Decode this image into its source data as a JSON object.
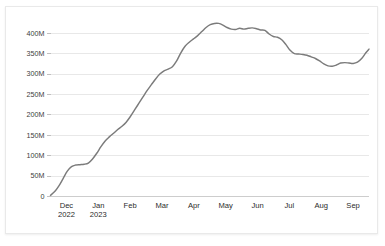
{
  "panel": {
    "background": "#ffffff",
    "border_color": "#e9e9e9"
  },
  "chart_data": {
    "type": "line",
    "title": "",
    "subtitle": "",
    "xlabel": "",
    "ylabel": "",
    "grid": true,
    "legend": false,
    "line_color": "#7b7b7b",
    "gridline_color": "#e2e2e2",
    "axis_color": "#c8c8c8",
    "ylim": [
      0,
      425000000
    ],
    "ytick_values": [
      0,
      50000000,
      100000000,
      150000000,
      200000000,
      250000000,
      300000000,
      350000000,
      400000000
    ],
    "ytick_labels": [
      "0",
      "50M",
      "100M",
      "150M",
      "200M",
      "250M",
      "300M",
      "350M",
      "400M"
    ],
    "xtick_labels": [
      {
        "month": "Dec",
        "year": "2022"
      },
      {
        "month": "Jan",
        "year": "2023"
      },
      {
        "month": "Feb",
        "year": ""
      },
      {
        "month": "Mar",
        "year": ""
      },
      {
        "month": "Apr",
        "year": ""
      },
      {
        "month": "May",
        "year": ""
      },
      {
        "month": "Jun",
        "year": ""
      },
      {
        "month": "Jul",
        "year": ""
      },
      {
        "month": "Aug",
        "year": ""
      },
      {
        "month": "Sep",
        "year": ""
      }
    ],
    "x_range": [
      "2022-12-01",
      "2023-09-30"
    ],
    "series": [
      {
        "name": "value",
        "x": [
          "2022-12-01",
          "2022-12-05",
          "2022-12-09",
          "2022-12-13",
          "2022-12-17",
          "2022-12-21",
          "2022-12-25",
          "2022-12-29",
          "2023-01-02",
          "2023-01-06",
          "2023-01-10",
          "2023-01-14",
          "2023-01-18",
          "2023-01-22",
          "2023-01-26",
          "2023-01-30",
          "2023-02-03",
          "2023-02-07",
          "2023-02-11",
          "2023-02-15",
          "2023-02-19",
          "2023-02-23",
          "2023-02-27",
          "2023-03-03",
          "2023-03-07",
          "2023-03-11",
          "2023-03-15",
          "2023-03-19",
          "2023-03-23",
          "2023-03-27",
          "2023-03-31",
          "2023-04-04",
          "2023-04-08",
          "2023-04-12",
          "2023-04-16",
          "2023-04-20",
          "2023-04-24",
          "2023-04-28",
          "2023-05-02",
          "2023-05-06",
          "2023-05-10",
          "2023-05-14",
          "2023-05-18",
          "2023-05-22",
          "2023-05-26",
          "2023-05-30",
          "2023-06-03",
          "2023-06-07",
          "2023-06-11",
          "2023-06-15",
          "2023-06-19",
          "2023-06-23",
          "2023-06-27",
          "2023-07-01",
          "2023-07-05",
          "2023-07-09",
          "2023-07-13",
          "2023-07-17",
          "2023-07-21",
          "2023-07-25",
          "2023-07-29",
          "2023-08-02",
          "2023-08-06",
          "2023-08-10",
          "2023-08-14",
          "2023-08-18",
          "2023-08-22",
          "2023-08-26",
          "2023-08-30",
          "2023-09-03",
          "2023-09-07",
          "2023-09-11",
          "2023-09-15",
          "2023-09-19",
          "2023-09-23",
          "2023-09-27",
          "2023-09-30"
        ],
        "values": [
          3000000,
          12000000,
          26000000,
          44000000,
          62000000,
          73000000,
          77000000,
          78000000,
          79000000,
          82000000,
          92000000,
          106000000,
          122000000,
          136000000,
          146000000,
          155000000,
          164000000,
          172000000,
          182000000,
          196000000,
          212000000,
          228000000,
          244000000,
          260000000,
          274000000,
          288000000,
          300000000,
          308000000,
          312000000,
          318000000,
          332000000,
          352000000,
          368000000,
          378000000,
          386000000,
          394000000,
          404000000,
          414000000,
          421000000,
          424000000,
          424000000,
          420000000,
          414000000,
          410000000,
          409000000,
          412000000,
          410000000,
          412000000,
          413000000,
          411000000,
          408000000,
          407000000,
          398000000,
          392000000,
          390000000,
          384000000,
          372000000,
          358000000,
          350000000,
          349000000,
          348000000,
          346000000,
          342000000,
          338000000,
          332000000,
          325000000,
          320000000,
          319000000,
          322000000,
          327000000,
          328000000,
          327000000,
          326000000,
          329000000,
          338000000,
          352000000,
          361000000
        ]
      }
    ]
  }
}
